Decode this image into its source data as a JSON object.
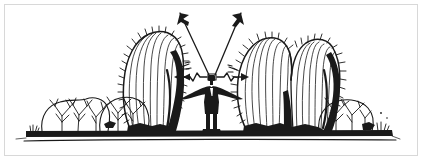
{
  "illustration": {
    "title": "Person standing among desert cacti and shrubs with arrows radiating outward",
    "alt_text": "Black and white line drawing of a figure in a suit standing on a desert ground line between tall ribbed cacti and low branching bushes; four arrows radiate from the figure's head, two diagonally upward and two horizontally outward with zigzag kinks toward the cacti.",
    "style": "pen-and-ink line drawing",
    "colors": {
      "ink": "#1a1a1a",
      "background": "#ffffff",
      "frame_border": "#d8d8d8"
    },
    "canvas": {
      "width": 423,
      "height": 161
    },
    "elements": [
      {
        "name": "left-cactus",
        "label": "Tall ribbed barrel cactus (left)",
        "description": "Large upright cactus with vertical ribs, spined outline, and heavy shading along its right side"
      },
      {
        "name": "right-cactus-pair",
        "label": "Paired ribbed cacti (right)",
        "description": "Two adjacent ribbed cacti forming a double-lobed silhouette with spined edges and shading"
      },
      {
        "name": "left-bush-group",
        "label": "Low desert shrubs (left)",
        "description": "Two rounded branching bushes drawn with fine twig strokes"
      },
      {
        "name": "right-bush-group",
        "label": "Low desert shrub (right)",
        "description": "Rounded branching bush drawn with fine twig strokes"
      },
      {
        "name": "standing-figure",
        "label": "Person in suit",
        "description": "Small dark figure standing front-facing with arms outstretched"
      },
      {
        "name": "ground-line",
        "label": "Desert ground",
        "description": "Heavy horizontal black band with a thinner line beneath"
      }
    ],
    "arrows": [
      {
        "name": "arrow-up-left",
        "direction": "up-left",
        "style": "straight",
        "origin": "figure-head"
      },
      {
        "name": "arrow-up-right",
        "direction": "up-right",
        "style": "straight",
        "origin": "figure-head"
      },
      {
        "name": "arrow-left",
        "direction": "left",
        "style": "zigzag",
        "origin": "figure-head",
        "target": "left-cactus"
      },
      {
        "name": "arrow-right",
        "direction": "right",
        "style": "zigzag",
        "origin": "figure-head",
        "target": "right-cactus-pair"
      }
    ]
  }
}
